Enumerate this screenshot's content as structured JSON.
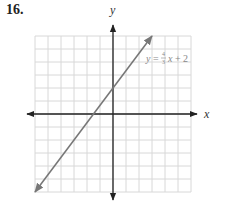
{
  "problem_number": "16.",
  "chart_data": {
    "type": "line",
    "title": "",
    "xlabel": "x",
    "ylabel": "y",
    "xlim": [
      -6,
      6
    ],
    "ylim": [
      -6,
      6
    ],
    "grid": true,
    "grid_step": 1,
    "series": [
      {
        "name": "y = 4/3 x + 2",
        "equation": "y = (4/3)x + 2",
        "slope": 1.3333,
        "intercept": 2,
        "x": [
          -6,
          3
        ],
        "y": [
          -6,
          6
        ],
        "color": "#777777",
        "arrows": "both"
      }
    ],
    "annotations": [
      {
        "text": "y = 4/3 x + 2",
        "x": 3.2,
        "y": 4.5
      }
    ]
  },
  "labels": {
    "x_axis": "x",
    "y_axis": "y",
    "eq_y": "y",
    "eq_eq": " = ",
    "eq_num": "4",
    "eq_den": "3",
    "eq_x": "x",
    "eq_plus": " + 2"
  },
  "colors": {
    "grid": "#d8d8d8",
    "axis": "#222222",
    "line": "#777777",
    "equation": "#888888"
  }
}
